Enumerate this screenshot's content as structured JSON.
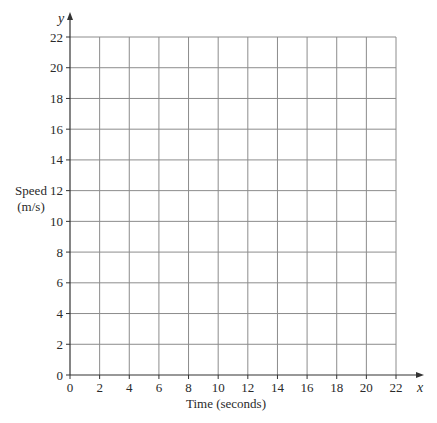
{
  "chart_data": {
    "type": "line",
    "title": "",
    "xlabel": "Time (seconds)",
    "ylabel": "Speed (m/s)",
    "ylabel_lines": [
      "Speed",
      "(m/s)"
    ],
    "x_axis_var": "x",
    "y_axis_var": "y",
    "xlim": [
      0,
      22
    ],
    "ylim": [
      0,
      22
    ],
    "x_ticks": [
      0,
      2,
      4,
      6,
      8,
      10,
      12,
      14,
      16,
      18,
      20,
      22
    ],
    "y_ticks": [
      0,
      2,
      4,
      6,
      8,
      10,
      12,
      14,
      16,
      18,
      20,
      22
    ],
    "grid": true,
    "series": [],
    "legend": null
  },
  "layout": {
    "origin_px": [
      70,
      375
    ],
    "x_max_px": 396,
    "y_max_px": 37,
    "x_arrow_end": 424,
    "y_arrow_end": 12
  },
  "colors": {
    "grid": "#8c8c8c",
    "axis": "#333333",
    "text": "#2a2a2a"
  }
}
